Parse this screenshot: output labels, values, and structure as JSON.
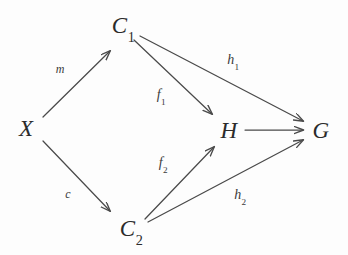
{
  "diagram": {
    "type": "commutative-diagram",
    "background_color": "#fdfdfd",
    "stroke_color": "#4a4a4a",
    "text_color": "#2b2b2b",
    "nodes": [
      {
        "id": "X",
        "base": "X",
        "sub": "",
        "text": "X",
        "x": 26,
        "y": 128
      },
      {
        "id": "C1",
        "base": "C",
        "sub": "1",
        "text": "C1",
        "x": 123,
        "y": 27
      },
      {
        "id": "C2",
        "base": "C",
        "sub": "2",
        "text": "C2",
        "x": 131,
        "y": 230
      },
      {
        "id": "H",
        "base": "H",
        "sub": "",
        "text": "H",
        "x": 229,
        "y": 130
      },
      {
        "id": "G",
        "base": "G",
        "sub": "",
        "text": "G",
        "x": 321,
        "y": 130
      }
    ],
    "edges": [
      {
        "id": "m",
        "from": "X",
        "to": "C1",
        "base": "m",
        "sub": "",
        "text": "m",
        "label_x": 60,
        "label_y": 69,
        "size": "small"
      },
      {
        "id": "c",
        "from": "X",
        "to": "C2",
        "base": "c",
        "sub": "",
        "text": "c",
        "label_x": 68,
        "label_y": 194,
        "size": "small"
      },
      {
        "id": "f1",
        "from": "C1",
        "to": "H",
        "base": "f",
        "sub": "1",
        "text": "f1",
        "label_x": 161,
        "label_y": 97,
        "size": "normal"
      },
      {
        "id": "h1",
        "from": "C1",
        "to": "G",
        "base": "h",
        "sub": "1",
        "text": "h1",
        "label_x": 233,
        "label_y": 62,
        "size": "normal"
      },
      {
        "id": "f2",
        "from": "C2",
        "to": "H",
        "base": "f",
        "sub": "2",
        "text": "f2",
        "label_x": 163,
        "label_y": 165,
        "size": "normal"
      },
      {
        "id": "h2",
        "from": "C2",
        "to": "G",
        "base": "h",
        "sub": "2",
        "text": "h2",
        "label_x": 240,
        "label_y": 197,
        "size": "normal"
      },
      {
        "id": "hg",
        "from": "H",
        "to": "G",
        "base": "",
        "sub": "",
        "text": "",
        "label_x": 0,
        "label_y": 0,
        "size": "normal"
      }
    ]
  }
}
